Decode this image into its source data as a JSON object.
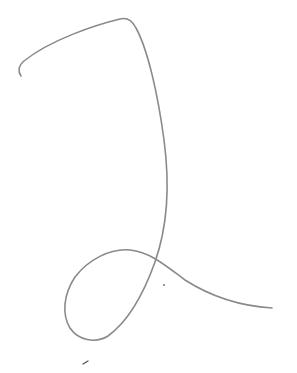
{
  "sketch": {
    "label": "Hand-drawn digit 2",
    "background": "#ffffff",
    "stroke_color": "#8a8a8a",
    "stroke_width": 1.6,
    "strokes": [
      {
        "name": "main-stroke",
        "d": "M 21 76 C 18 72, 18 66, 24 61 C 50 40, 95 25, 120 19 C 128 17, 133 22, 136 28 C 148 50, 158 95, 164 140 C 170 185, 168 225, 155 262 C 145 290, 130 320, 108 336 C 95 344, 78 340, 70 328 C 62 315, 63 295, 75 277 C 88 260, 110 248, 130 250 C 150 252, 165 265, 185 280 C 210 296, 240 306, 272 308"
      }
    ],
    "marks": [
      {
        "name": "dot-mark",
        "cx": 164,
        "cy": 285,
        "r": 0.9
      },
      {
        "name": "tick-mark",
        "x1": 83,
        "y1": 364,
        "x2": 88,
        "y2": 361
      }
    ]
  }
}
